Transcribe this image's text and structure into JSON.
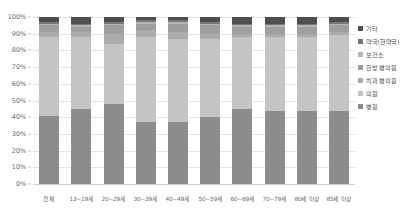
{
  "chart_data": {
    "type": "bar",
    "stacked": true,
    "stack_mode": "percent",
    "title": "",
    "subtitle": "",
    "xlabel": "",
    "ylabel": "",
    "ylim": [
      0,
      100
    ],
    "ytick_labels": [
      "100%",
      "90%",
      "80%",
      "70%",
      "60%",
      "50%",
      "40%",
      "30%",
      "20%",
      "10%",
      "0%"
    ],
    "ytick_values": [
      100,
      90,
      80,
      70,
      60,
      50,
      40,
      30,
      20,
      10,
      0
    ],
    "grid": true,
    "legend_position": "right",
    "categories": [
      "전체",
      "13~19세",
      "20~29세",
      "30~39세",
      "40~49세",
      "50~59세",
      "60~69세",
      "70~79세",
      "80세 이상",
      "85세 이상"
    ],
    "series": [
      {
        "name": "병원",
        "color": "#8c8c8c",
        "values": [
          41,
          45,
          48,
          37,
          37,
          40,
          45,
          44,
          44,
          44
        ]
      },
      {
        "name": "의원",
        "color": "#c4c4c4",
        "values": [
          47,
          43,
          36,
          51,
          50,
          47,
          43,
          44,
          44,
          45
        ]
      },
      {
        "name": "치과 병의원",
        "color": "#ababab",
        "values": [
          3,
          3,
          6,
          4,
          4,
          3,
          2,
          2,
          2,
          2
        ]
      },
      {
        "name": "한방 병의원",
        "color": "#9e9e9e",
        "values": [
          4,
          3,
          5,
          4,
          5,
          5,
          4,
          4,
          4,
          4
        ]
      },
      {
        "name": "보건소",
        "color": "#b5b5b5",
        "values": [
          1,
          1,
          1,
          1,
          1,
          1,
          1,
          1,
          1,
          1
        ]
      },
      {
        "name": "약국(한약국)",
        "color": "#777777",
        "values": [
          1,
          1,
          1,
          1,
          1,
          1,
          1,
          1,
          1,
          1
        ]
      },
      {
        "name": "기타",
        "color": "#4f4f4f",
        "values": [
          3,
          4,
          3,
          2,
          2,
          3,
          4,
          4,
          4,
          3
        ]
      }
    ]
  },
  "legend": {
    "items": [
      {
        "label": "기타",
        "color": "#4f4f4f"
      },
      {
        "label": "약국(한약국)",
        "color": "#777777"
      },
      {
        "label": "보건소",
        "color": "#b5b5b5"
      },
      {
        "label": "한방 병의원",
        "color": "#9e9e9e"
      },
      {
        "label": "치과 병의원",
        "color": "#ababab"
      },
      {
        "label": "의원",
        "color": "#c4c4c4"
      },
      {
        "label": "병원",
        "color": "#8c8c8c"
      }
    ]
  }
}
